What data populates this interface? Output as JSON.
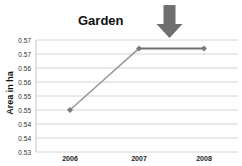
{
  "chart_data": {
    "type": "line",
    "title": "Garden",
    "xlabel": "",
    "ylabel": "Area in ha",
    "categories": [
      "2006",
      "2007",
      "2008"
    ],
    "series": [
      {
        "name": "Garden",
        "values": [
          0.545,
          0.567,
          0.567
        ],
        "color": "#9a9a9a",
        "highlight_segment_color": "#6e6e6e"
      }
    ],
    "y_ticks": [
      "0.53",
      "0.54",
      "0.54",
      "0.55",
      "0.55",
      "0.56",
      "0.56",
      "0.57",
      "0.57"
    ],
    "ylim": [
      0.53,
      0.57
    ],
    "grid": true,
    "legend": "none",
    "annotations": [
      {
        "type": "down-arrow",
        "position": "above 2007-2008 segment",
        "color": "#707070"
      }
    ]
  }
}
